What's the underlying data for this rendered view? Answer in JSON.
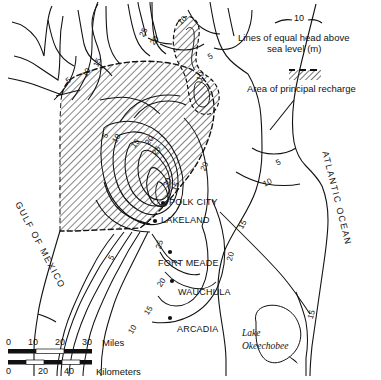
{
  "map": {
    "title": "Potentiometric surface map of central Florida",
    "legend": {
      "contour_symbol_value": "10",
      "contour_caption_line1": "Lines of equal head above",
      "contour_caption_line2": "sea level (m)",
      "recharge_caption": "Area of principal recharge"
    },
    "water_bodies": [
      {
        "name": "GULF OF MEXICO",
        "style": "rotated"
      },
      {
        "name": "ATLANTIC OCEAN",
        "style": "rotated"
      },
      {
        "name": "Lake",
        "name2": "Okeechobee",
        "style": "italic"
      }
    ],
    "cities": [
      {
        "label": "POLK CITY"
      },
      {
        "label": "LAKELAND"
      },
      {
        "label": "FORT MEADE"
      },
      {
        "label": "WAUCHULA"
      },
      {
        "label": "ARCADIA"
      }
    ],
    "contour_labels": [
      {
        "value": "10",
        "x": 178,
        "y": 16
      },
      {
        "value": "25",
        "x": 139,
        "y": 28
      },
      {
        "value": "20",
        "x": 150,
        "y": 36
      },
      {
        "value": "15",
        "x": 93,
        "y": 58
      },
      {
        "value": "10",
        "x": 82,
        "y": 68
      },
      {
        "value": "5",
        "x": 66,
        "y": 76
      },
      {
        "value": "5",
        "x": 208,
        "y": 52
      },
      {
        "value": "10",
        "x": 196,
        "y": 72
      },
      {
        "value": "5",
        "x": 103,
        "y": 131
      },
      {
        "value": "10",
        "x": 112,
        "y": 134
      },
      {
        "value": "15",
        "x": 131,
        "y": 139
      },
      {
        "value": "20",
        "x": 145,
        "y": 136
      },
      {
        "value": "25",
        "x": 152,
        "y": 146
      },
      {
        "value": "30",
        "x": 163,
        "y": 178
      },
      {
        "value": "15",
        "x": 171,
        "y": 182
      },
      {
        "value": "20",
        "x": 200,
        "y": 162
      },
      {
        "value": "5",
        "x": 276,
        "y": 158
      },
      {
        "value": "10",
        "x": 263,
        "y": 178
      },
      {
        "value": "15",
        "x": 238,
        "y": 220
      },
      {
        "value": "25",
        "x": 155,
        "y": 240
      },
      {
        "value": "20",
        "x": 226,
        "y": 252
      },
      {
        "value": "20",
        "x": 157,
        "y": 278
      },
      {
        "value": "15",
        "x": 144,
        "y": 306
      },
      {
        "value": "10",
        "x": 128,
        "y": 325
      },
      {
        "value": "5",
        "x": 109,
        "y": 253
      },
      {
        "value": "15",
        "x": 307,
        "y": 310
      }
    ],
    "scale_bars": [
      {
        "unit": "Miles",
        "ticks": [
          "0",
          "10",
          "20",
          "30"
        ]
      },
      {
        "unit": "Kilometers",
        "ticks": [
          "0",
          "20",
          "40"
        ]
      }
    ],
    "colors": {
      "ink": "#111111",
      "paper": "#ffffff",
      "hatch": "#444444"
    }
  }
}
